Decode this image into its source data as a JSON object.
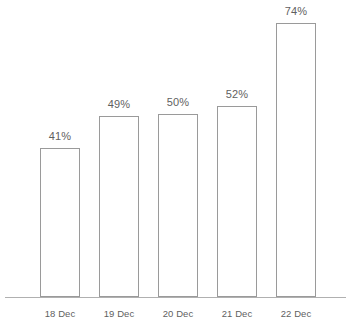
{
  "chart_data": {
    "type": "bar",
    "title": "",
    "subtitle": "",
    "xlabel": "",
    "ylabel": "",
    "categories": [
      "18 Dec",
      "19 Dec",
      "20 Dec",
      "21 Dec",
      "22 Dec"
    ],
    "values": [
      41,
      49,
      50,
      52,
      74
    ],
    "value_labels": [
      "41%",
      "49%",
      "50%",
      "52%",
      "74%"
    ],
    "unit": "%",
    "ylim": [
      0,
      80
    ],
    "grid": false,
    "legend": null,
    "legend_position": "none",
    "annotations": [],
    "series": [
      {
        "name": "",
        "values": [
          41,
          49,
          50,
          52,
          74
        ]
      }
    ]
  },
  "style": {
    "background_color": "#ffffff",
    "bar_fill_color": "#ffffff",
    "bar_stroke_color": "#9a9a9a",
    "axis_color": "#b0b0b0",
    "label_color": "#5f5f5f"
  },
  "geometry": {
    "width": 353,
    "height": 329,
    "axis_y": 297,
    "axis_x_start": 5,
    "axis_x_end": 346,
    "bar_width": 40,
    "bars": [
      {
        "x": 40,
        "top": 148
      },
      {
        "x": 99,
        "top": 116
      },
      {
        "x": 158,
        "top": 114
      },
      {
        "x": 217,
        "top": 106
      },
      {
        "x": 276,
        "top": 23
      }
    ],
    "value_label_offset": 18,
    "category_label_y": 308
  }
}
